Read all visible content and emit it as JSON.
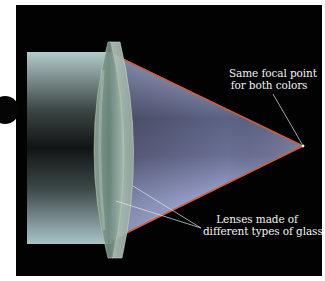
{
  "diagram": {
    "labels": {
      "focal_point_line1": "Same focal point",
      "focal_point_line2": "for both colors",
      "lenses_line1": "Lenses made of",
      "lenses_line2": "different types of glass"
    },
    "colors": {
      "background": "#020202",
      "beam_light": "#a9c2c4",
      "beam_dark": "#151818",
      "cone_blue": "#9ea8d8",
      "lens_glass": "#9fb5a9",
      "red_edge": "#d0603a",
      "leader_line": "#e8e8e8"
    },
    "geometry": {
      "focal_point": [
        303,
        146
      ],
      "beam_rect": {
        "x": 27,
        "y": 52,
        "w": 85,
        "h": 192
      },
      "lens_span": {
        "x1": 88,
        "x2": 140,
        "y1": 40,
        "y2": 258
      }
    }
  }
}
